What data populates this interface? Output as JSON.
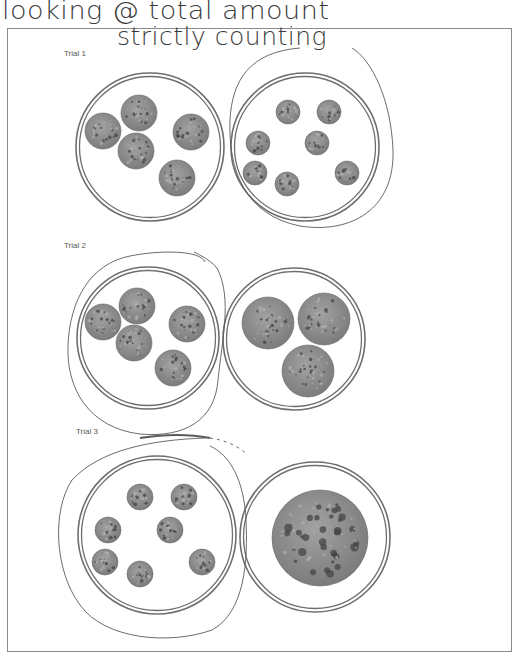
{
  "annotations": {
    "line1": "looking @ total amount",
    "line2": "strictly counting"
  },
  "colors": {
    "plate_rim": "#6e6e6e",
    "cookie_fill": "#8f8f8f",
    "cookie_dark": "#444444",
    "pen": "#5a5a5a",
    "frame": "#8a8a8a"
  },
  "trials": [
    {
      "label": "Trial 1",
      "label_pos": [
        64,
        56
      ],
      "circled_plate": "right",
      "plates": [
        {
          "side": "left",
          "cx": 150,
          "cy": 147,
          "r": 74,
          "cookie_count": 5,
          "cookies": [
            [
              103,
              131,
              18
            ],
            [
              139,
              113,
              18
            ],
            [
              191,
              132,
              18
            ],
            [
              136,
              151,
              18
            ],
            [
              177,
              178,
              18
            ]
          ]
        },
        {
          "side": "right",
          "cx": 305,
          "cy": 147,
          "r": 74,
          "cookie_count": 7,
          "cookies": [
            [
              288,
              112,
              12
            ],
            [
              329,
              112,
              12
            ],
            [
              258,
              143,
              12
            ],
            [
              317,
              143,
              12
            ],
            [
              255,
              173,
              12
            ],
            [
              287,
              184,
              12
            ],
            [
              347,
              173,
              12
            ]
          ]
        }
      ]
    },
    {
      "label": "Trial 2",
      "label_pos": [
        64,
        247
      ],
      "circled_plate": "left",
      "plates": [
        {
          "side": "left",
          "cx": 148,
          "cy": 338,
          "r": 71,
          "cookie_count": 5,
          "cookies": [
            [
              103,
              322,
              18
            ],
            [
              137,
              306,
              18
            ],
            [
              187,
              324,
              18
            ],
            [
              134,
              343,
              18
            ],
            [
              173,
              368,
              18
            ]
          ]
        },
        {
          "side": "right",
          "cx": 294,
          "cy": 339,
          "r": 71,
          "cookie_count": 3,
          "cookies": [
            [
              268,
              323,
              26
            ],
            [
              324,
              319,
              26
            ],
            [
              308,
              371,
              26
            ]
          ]
        }
      ]
    },
    {
      "label": "Trial 3",
      "label_pos": [
        76,
        432
      ],
      "circled_plate": "left",
      "plates": [
        {
          "side": "left",
          "cx": 157,
          "cy": 535,
          "r": 79,
          "cookie_count": 7,
          "cookies": [
            [
              140,
              497,
              13
            ],
            [
              184,
              497,
              13
            ],
            [
              108,
              530,
              13
            ],
            [
              170,
              530,
              13
            ],
            [
              105,
              562,
              13
            ],
            [
              140,
              574,
              13
            ],
            [
              202,
              562,
              13
            ]
          ]
        },
        {
          "side": "right",
          "cx": 315,
          "cy": 537,
          "r": 75,
          "cookie_count": 1,
          "cookies": [
            [
              320,
              538,
              48
            ]
          ]
        }
      ]
    }
  ]
}
